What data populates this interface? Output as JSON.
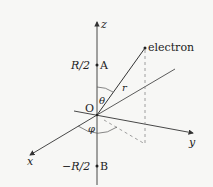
{
  "diagram": {
    "title": "",
    "axes": {
      "z": {
        "label": "z"
      },
      "x": {
        "label": "x"
      },
      "y": {
        "label": "y"
      }
    },
    "origin_label": "O",
    "points": {
      "A": {
        "label": "A",
        "coord_label": "R/2"
      },
      "B": {
        "label": "B",
        "coord_label": "−R/2"
      },
      "electron": {
        "label": "electron"
      }
    },
    "vector_label": "r",
    "angles": {
      "theta": "θ",
      "phi": "φ"
    },
    "colors": {
      "line": "#333333",
      "dashed": "#888888",
      "text": "#222222",
      "background": "#f7f7f5"
    }
  }
}
